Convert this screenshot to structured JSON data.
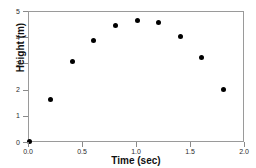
{
  "chart_data": {
    "type": "scatter",
    "title": "",
    "xlabel": "Time (sec)",
    "ylabel": "Height (m)",
    "xlim": [
      0.0,
      2.0
    ],
    "ylim": [
      0,
      5
    ],
    "xticks": [
      "0.0",
      "0.5",
      "1.0",
      "1.5",
      "2.0"
    ],
    "xtick_values": [
      0.0,
      0.5,
      1.0,
      1.5,
      2.0
    ],
    "yticks": [
      "0",
      "1",
      "2",
      "3",
      "4",
      "5"
    ],
    "ytick_values": [
      0,
      1,
      2,
      3,
      4,
      5
    ],
    "grid": false,
    "legend": false,
    "marker": "filled-circle",
    "marker_color": "#000000",
    "frame_color": "#9a9a9a",
    "x": [
      0.0,
      0.2,
      0.4,
      0.6,
      0.8,
      1.0,
      1.2,
      1.4,
      1.6,
      1.8
    ],
    "values": [
      0.05,
      1.65,
      3.1,
      3.9,
      4.47,
      4.68,
      4.6,
      4.05,
      3.25,
      2.05
    ],
    "series": [
      {
        "name": "Height",
        "values": [
          0.05,
          1.65,
          3.1,
          3.9,
          4.47,
          4.68,
          4.6,
          4.05,
          3.25,
          2.05
        ]
      }
    ]
  }
}
